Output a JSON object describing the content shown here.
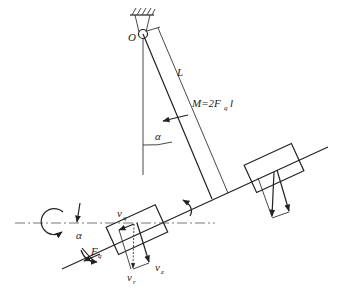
{
  "diagram": {
    "labels": {
      "pivot": "O",
      "length": "L",
      "moment_main": "M=2F",
      "moment_sub": "q",
      "moment_tail": "l",
      "angle_upper": "α",
      "angle_lower": "α",
      "force_main": "F",
      "force_sub": "q",
      "velocity_q_main": "v",
      "velocity_q_sub": "q",
      "velocity_r_main": "v",
      "velocity_r_sub": "r",
      "velocity_z_main": "v",
      "velocity_z_sub": "z"
    },
    "colors": {
      "stroke": "#222222",
      "background": "#ffffff"
    }
  }
}
